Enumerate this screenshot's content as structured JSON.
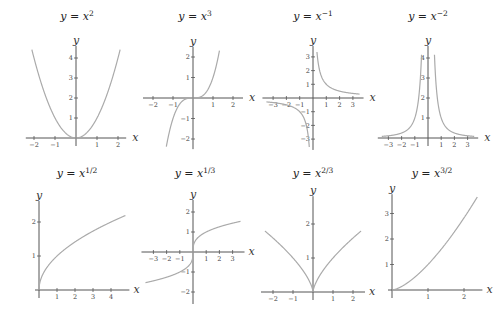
{
  "chart_data": [
    {
      "type": "line",
      "title": "y = x^2",
      "title_base": "y = x",
      "title_exp": "2",
      "xlabel": "x",
      "ylabel": "y",
      "xticks": [
        -2,
        -1,
        1,
        2
      ],
      "yticks": [
        1,
        2,
        3,
        4
      ],
      "xlim": [
        -2.2,
        2.2
      ],
      "ylim": [
        0,
        4.4
      ],
      "func": "x^2",
      "x": [
        -2.1,
        -1.5,
        -1,
        -0.5,
        0,
        0.5,
        1,
        1.5,
        2.1
      ],
      "y": [
        4.41,
        2.25,
        1,
        0.25,
        0,
        0.25,
        1,
        2.25,
        4.41
      ],
      "grid": false
    },
    {
      "type": "line",
      "title": "y = x^3",
      "title_base": "y = x",
      "title_exp": "3",
      "xlabel": "x",
      "ylabel": "y",
      "xticks": [
        -2,
        -1,
        1,
        2
      ],
      "yticks": [
        -2,
        -1,
        1,
        2
      ],
      "xlim": [
        -2.3,
        2.3
      ],
      "ylim": [
        -2.3,
        2.3
      ],
      "func": "x^3",
      "x": [
        -1.32,
        -1,
        -0.5,
        0,
        0.5,
        1,
        1.32
      ],
      "y": [
        -2.3,
        -1,
        -0.125,
        0,
        0.125,
        1,
        2.3
      ],
      "grid": false
    },
    {
      "type": "line",
      "title": "y = x^-1",
      "title_base": "y = x",
      "title_exp": "−1",
      "xlabel": "x",
      "ylabel": "y",
      "xticks": [
        -3,
        -2,
        -1,
        1,
        2,
        3
      ],
      "yticks": [
        -3,
        -2,
        -1,
        1,
        2,
        3
      ],
      "xlim": [
        -3.5,
        3.5
      ],
      "ylim": [
        -3.5,
        3.5
      ],
      "func": "1/x",
      "x": [
        -3.6,
        -2,
        -1,
        -0.5,
        -0.28,
        0.28,
        0.5,
        1,
        2,
        3.6
      ],
      "y": [
        -0.28,
        -0.5,
        -1,
        -2,
        -3.6,
        3.6,
        2,
        1,
        0.5,
        0.28
      ],
      "grid": false
    },
    {
      "type": "line",
      "title": "y = x^-2",
      "title_base": "y = x",
      "title_exp": "−2",
      "xlabel": "x",
      "ylabel": "y",
      "xticks": [
        -3,
        -2,
        -1,
        1,
        2,
        3
      ],
      "yticks": [
        1,
        2,
        3,
        4
      ],
      "xlim": [
        -3.5,
        3.5
      ],
      "ylim": [
        0,
        4.4
      ],
      "func": "1/x^2",
      "x": [
        -3.5,
        -2,
        -1,
        -0.5,
        0.5,
        1,
        2,
        3.5
      ],
      "y": [
        0.08,
        0.25,
        1,
        4,
        4,
        1,
        0.25,
        0.08
      ],
      "grid": false
    },
    {
      "type": "line",
      "title": "y = x^1/2",
      "title_base": "y = x",
      "title_exp": "1/2",
      "xlabel": "x",
      "ylabel": "y",
      "xticks": [
        1,
        2,
        3,
        4
      ],
      "yticks": [
        1,
        2
      ],
      "xlim": [
        0,
        4.8
      ],
      "ylim": [
        0,
        2.5
      ],
      "func": "sqrt(x)",
      "x": [
        0,
        1,
        2,
        3,
        4,
        4.7
      ],
      "y": [
        0,
        1,
        1.41,
        1.73,
        2,
        2.17
      ],
      "grid": false
    },
    {
      "type": "line",
      "title": "y = x^1/3",
      "title_base": "y = x",
      "title_exp": "1/3",
      "xlabel": "x",
      "ylabel": "y",
      "xticks": [
        -3,
        -2,
        -1,
        1,
        2,
        3
      ],
      "yticks": [
        -2,
        -1,
        1,
        2
      ],
      "xlim": [
        -3.6,
        3.6
      ],
      "ylim": [
        -2.4,
        2.4
      ],
      "func": "cbrt(x)",
      "x": [
        -3.6,
        -1,
        0,
        1,
        3.6
      ],
      "y": [
        -1.53,
        -1,
        0,
        1,
        1.53
      ],
      "grid": false
    },
    {
      "type": "line",
      "title": "y = x^2/3",
      "title_base": "y = x",
      "title_exp": "2/3",
      "xlabel": "x",
      "ylabel": "y",
      "xticks": [
        -2,
        -1,
        1,
        2
      ],
      "yticks": [
        1,
        2
      ],
      "xlim": [
        -2.4,
        2.4
      ],
      "ylim": [
        0,
        2.7
      ],
      "func": "x^(2/3)",
      "x": [
        -2.4,
        -1,
        0,
        1,
        2.4
      ],
      "y": [
        1.79,
        1,
        0,
        1,
        1.79
      ],
      "grid": false
    },
    {
      "type": "line",
      "title": "y = x^3/2",
      "title_base": "y = x",
      "title_exp": "3/2",
      "xlabel": "x",
      "ylabel": "y",
      "xticks": [
        1,
        2
      ],
      "yticks": [
        1,
        2,
        3
      ],
      "xlim": [
        0,
        2.4
      ],
      "ylim": [
        0,
        3.6
      ],
      "func": "x^(3/2)",
      "x": [
        0,
        1,
        2,
        2.3
      ],
      "y": [
        0,
        1,
        2.83,
        3.49
      ],
      "grid": false
    }
  ],
  "style": {
    "curve_color": "#aaaaaa",
    "axis_color": "#555555",
    "text_color": "#222222"
  }
}
